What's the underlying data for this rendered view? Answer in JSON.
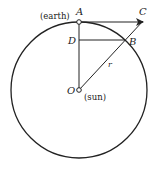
{
  "diagram": {
    "labels": {
      "A": "A",
      "B": "B",
      "C": "C",
      "D": "D",
      "O": "O",
      "r": "r",
      "earth": "(earth)",
      "sun": "(sun)"
    },
    "colors": {
      "stroke": "#222222",
      "background": "#ffffff"
    }
  }
}
